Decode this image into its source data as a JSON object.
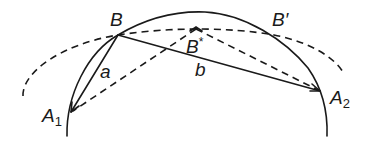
{
  "diagram": {
    "colors": {
      "stroke": "#1a1a1a",
      "background": "#ffffff"
    },
    "points": {
      "B": {
        "label": "B",
        "sup": "",
        "sub": ""
      },
      "B_star": {
        "label": "B",
        "sup": "*",
        "sub": ""
      },
      "B_prime": {
        "label": "B′",
        "sup": "",
        "sub": ""
      },
      "A1": {
        "label": "A",
        "sup": "",
        "sub": "1"
      },
      "A2": {
        "label": "A",
        "sup": "",
        "sub": "2"
      }
    },
    "segments": {
      "a": {
        "label": "a"
      },
      "b": {
        "label": "b"
      }
    }
  }
}
